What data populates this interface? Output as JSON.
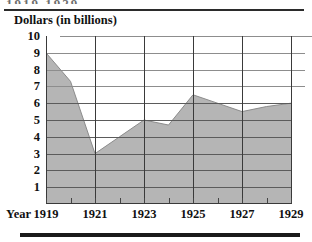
{
  "figure": {
    "cropped_heading": "1919   1929",
    "axis_title": "Dollars (in billions)",
    "year_axis_label": "Year"
  },
  "chart_data": {
    "type": "area",
    "title": "Dollars (in billions)",
    "xlabel": "Year",
    "ylabel": "Dollars (in billions)",
    "x": [
      1919,
      1920,
      1921,
      1922,
      1923,
      1924,
      1925,
      1926,
      1927,
      1928,
      1929
    ],
    "values": [
      9,
      7.3,
      3,
      4,
      5,
      4.7,
      6.5,
      6,
      5.5,
      5.8,
      6
    ],
    "xtick_labels": [
      "1919",
      "1921",
      "1923",
      "1925",
      "1927",
      "1929"
    ],
    "xticks": [
      1919,
      1921,
      1923,
      1925,
      1927,
      1929
    ],
    "ytick_labels": [
      "10",
      "9",
      "8",
      "7",
      "6",
      "5",
      "4",
      "3",
      "2",
      "1"
    ],
    "yticks": [
      10,
      9,
      8,
      7,
      6,
      5,
      4,
      3,
      2,
      1
    ],
    "ylim": [
      0,
      10
    ],
    "xlim": [
      1919,
      1929
    ],
    "grid": true,
    "legend": false,
    "fill_color": "#b5b5b5",
    "line_color": "#8c8c8c",
    "grid_color": "#5b5b5b",
    "text_color": "#111111"
  }
}
